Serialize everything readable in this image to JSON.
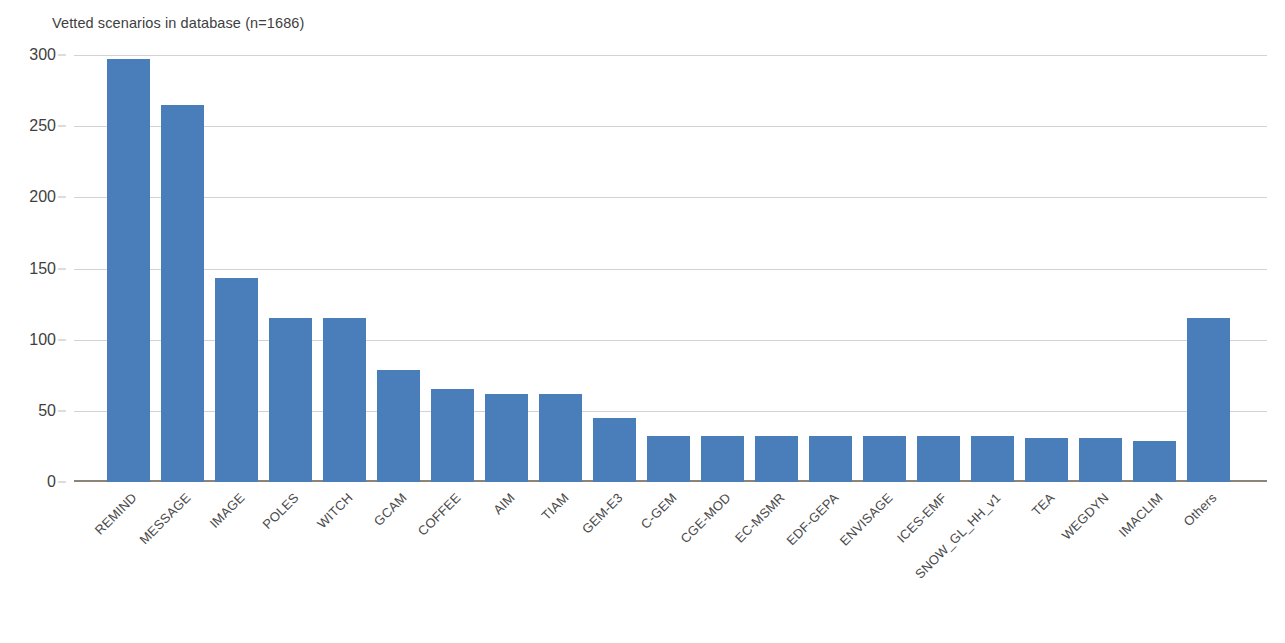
{
  "chart_data": {
    "type": "bar",
    "title": "Vetted scenarios in database (n=1686)",
    "xlabel": "",
    "ylabel": "",
    "ylim": [
      0,
      300
    ],
    "yticks": [
      0,
      50,
      100,
      150,
      200,
      250,
      300
    ],
    "grid": true,
    "legend": null,
    "bar_color": "#4a7ebb",
    "categories": [
      "REMIND",
      "MESSAGE",
      "IMAGE",
      "POLES",
      "WITCH",
      "GCAM",
      "COFFEE",
      "AIM",
      "TIAM",
      "GEM-E3",
      "C-GEM",
      "CGE-MOD",
      "EC-MSMR",
      "EDF-GEPA",
      "ENVISAGE",
      "ICES-EMF",
      "SNOW_GL_HH_v1",
      "TEA",
      "WEGDYN",
      "IMACLIM",
      "Others"
    ],
    "values": [
      297,
      265,
      143,
      115,
      115,
      79,
      65,
      62,
      62,
      45,
      32,
      32,
      32,
      32,
      32,
      32,
      32,
      31,
      31,
      29,
      115
    ]
  },
  "axis": {
    "y_tick_labels": [
      "300",
      "250",
      "200",
      "150",
      "100",
      "50",
      "0"
    ]
  }
}
